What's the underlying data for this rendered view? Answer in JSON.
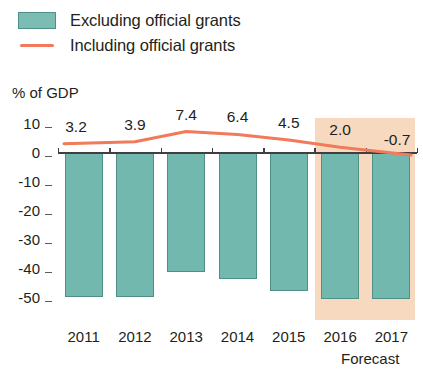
{
  "legend": {
    "items": [
      {
        "label": "Excluding official grants",
        "marker": "square-swatch",
        "color": "#73b8ae"
      },
      {
        "label": "Including official grants",
        "marker": "line-swatch",
        "color": "#f07a59"
      }
    ]
  },
  "axis_title": "% of GDP",
  "forecast_caption": "Forecast",
  "colors": {
    "bar_fill": "#73b8ae",
    "bar_stroke": "#4e8f86",
    "line": "#f07a59",
    "forecast_band": "#f6d9be",
    "axis": "#3f3f41",
    "text": "#231f20"
  },
  "chart_data": {
    "type": "bar",
    "title": "",
    "subtitle": "",
    "xlabel": "",
    "ylabel": "% of GDP",
    "categories": [
      "2011",
      "2012",
      "2013",
      "2014",
      "2015",
      "2016",
      "2017"
    ],
    "ylim": [
      -50,
      10
    ],
    "yticks": [
      10,
      0,
      -10,
      -20,
      -30,
      -40,
      -50
    ],
    "ytick_labels": [
      "10",
      "0",
      "-10",
      "-20",
      "-30",
      "-40",
      "-50"
    ],
    "grid": false,
    "legend_position": "top-left",
    "forecast_from": "2016",
    "series": [
      {
        "name": "Excluding official grants",
        "type": "bar",
        "color": "#73b8ae",
        "values": [
          -49.5,
          -49.5,
          -41.0,
          -43.5,
          -47.5,
          -50.5,
          -50.5
        ]
      },
      {
        "name": "Including official grants",
        "type": "line",
        "color": "#f07a59",
        "values": [
          3.2,
          3.9,
          7.4,
          6.4,
          4.5,
          2.0,
          -0.7
        ],
        "data_labels": [
          "3.2",
          "3.9",
          "7.4",
          "6.4",
          "4.5",
          "2.0",
          "-0.7"
        ]
      }
    ]
  }
}
